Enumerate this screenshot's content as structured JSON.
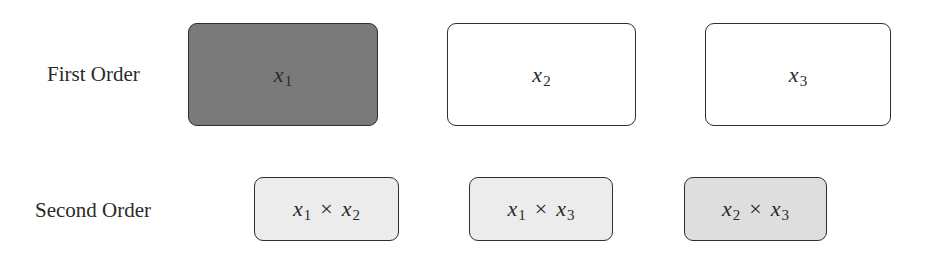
{
  "diagram": {
    "rows": [
      {
        "label": "First Order",
        "boxes": [
          {
            "var": "x",
            "sub": "1",
            "fill": "#7a7a7a"
          },
          {
            "var": "x",
            "sub": "2",
            "fill": "#ffffff"
          },
          {
            "var": "x",
            "sub": "3",
            "fill": "#ffffff"
          }
        ]
      },
      {
        "label": "Second Order",
        "boxes": [
          {
            "a_var": "x",
            "a_sub": "1",
            "op": "×",
            "b_var": "x",
            "b_sub": "2",
            "fill": "#ececec"
          },
          {
            "a_var": "x",
            "a_sub": "1",
            "op": "×",
            "b_var": "x",
            "b_sub": "3",
            "fill": "#ececec"
          },
          {
            "a_var": "x",
            "a_sub": "2",
            "op": "×",
            "b_var": "x",
            "b_sub": "3",
            "fill": "#dedede"
          }
        ]
      }
    ],
    "colors": {
      "border": "#2e2e2e",
      "text": "#2a2a2a"
    }
  }
}
